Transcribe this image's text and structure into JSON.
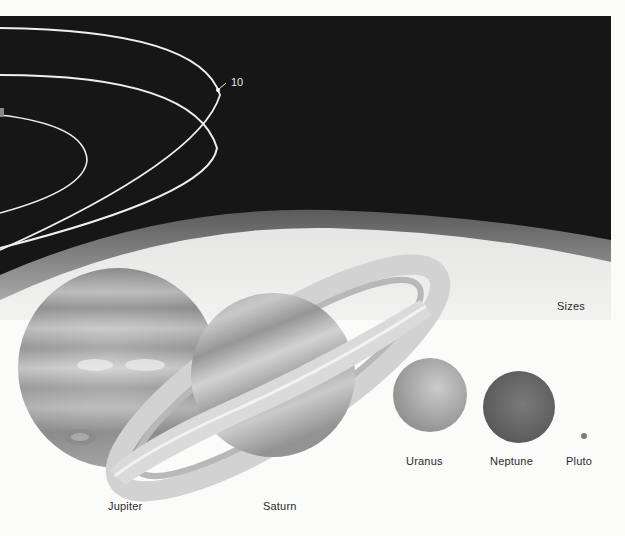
{
  "figure": {
    "orbit_marker": "10",
    "section_label": "Sizes",
    "planets": [
      {
        "name": "Jupiter",
        "color": "#9a9a9a"
      },
      {
        "name": "Saturn",
        "color": "#a8a8a8"
      },
      {
        "name": "Uranus",
        "color": "#b3b3b3"
      },
      {
        "name": "Neptune",
        "color": "#6f6f6f"
      },
      {
        "name": "Pluto",
        "color": "#7a7a7a"
      }
    ]
  },
  "colors": {
    "space": "#141414",
    "page": "#fbfbfa",
    "orbit": "#f2f2ee"
  }
}
